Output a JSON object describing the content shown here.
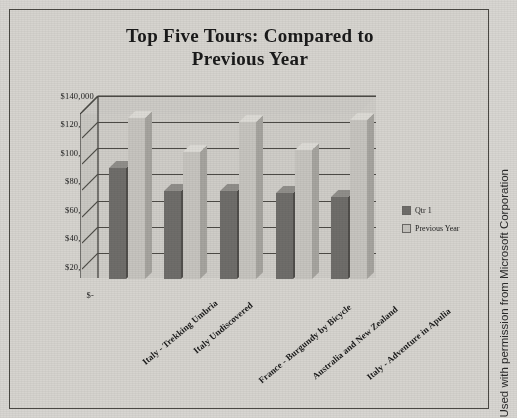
{
  "chart_data": {
    "type": "bar",
    "title": "Top Five Tours:  Compared to Previous Year",
    "title_line1": "Top Five Tours:  Compared to",
    "title_line2": "Previous Year",
    "xlabel": "",
    "ylabel": "",
    "ylim": [
      0,
      140000
    ],
    "grid": true,
    "legend_position": "right",
    "categories": [
      "Italy - Trekking Umbria",
      "Italy Undiscovered",
      "France - Burgundy by Bicycle",
      "Australia and New Zealand",
      "Italy - Adventure in Apulia"
    ],
    "series": [
      {
        "name": "Qtr 1",
        "color": "#6f6d6a",
        "values": [
          85000,
          67000,
          67000,
          66000,
          63000
        ]
      },
      {
        "name": "Previous Year",
        "color": "#c6c4bf",
        "values": [
          123000,
          97000,
          120000,
          99000,
          122000
        ]
      }
    ],
    "yticks": [
      {
        "value": 140000,
        "label": "$140,000"
      },
      {
        "value": 120000,
        "label": "$120,000"
      },
      {
        "value": 100000,
        "label": "$100,000"
      },
      {
        "value": 80000,
        "label": "$80,000"
      },
      {
        "value": 60000,
        "label": "$60,000"
      },
      {
        "value": 40000,
        "label": "$40,000"
      },
      {
        "value": 20000,
        "label": "$20,000"
      },
      {
        "value": 0,
        "label": "$-"
      }
    ]
  },
  "credit": {
    "text": "Used with permission from Microsoft Corporation"
  }
}
